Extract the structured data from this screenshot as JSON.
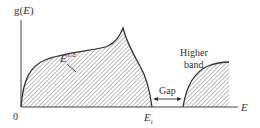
{
  "diagram": {
    "type": "density-of-states",
    "y_axis_label": "g(E)",
    "x_axis_label": "E",
    "origin_label": "0",
    "curve_label": "E^1/2",
    "curve_label_base": "E",
    "curve_label_exp": "1/2",
    "band_edge_label_base": "E",
    "band_edge_label_sub": "t",
    "gap_label": "Gap",
    "higher_band_label_line1": "Higher",
    "higher_band_label_line2": "band",
    "colors": {
      "line": "#333333",
      "hatch": "#555555",
      "background": "#ffffff"
    }
  }
}
